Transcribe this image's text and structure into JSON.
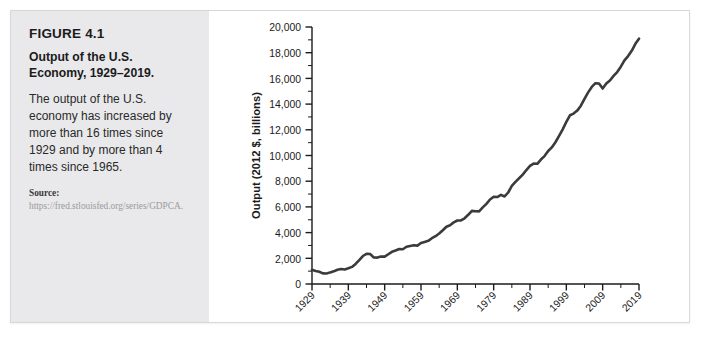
{
  "figure": {
    "number": "FIGURE 4.1",
    "title": "Output of the U.S. Economy, 1929–2019.",
    "description": "The output of the U.S. economy has increased by more than 16 times since 1929 and by more than 4 times since 1965.",
    "source_label": "Source:",
    "source_text": "https://fred.stlouisfed.org/series/GDPCA."
  },
  "colors": {
    "panel_background": "#e9e9eb",
    "chart_background": "#ffffff",
    "line": "#3b3b3b",
    "axis": "#1b1b1b",
    "text": "#1b1b1b"
  },
  "chart_data": {
    "type": "line",
    "title": "",
    "xlabel": "Year",
    "ylabel": "Output (2012 $, billions)",
    "xlim": [
      1929,
      2019
    ],
    "ylim": [
      0,
      20000
    ],
    "grid": false,
    "legend": "none",
    "xticks": [
      1929,
      1939,
      1949,
      1959,
      1969,
      1979,
      1989,
      1999,
      2009,
      2019
    ],
    "xtick_labels": [
      "1929",
      "1939",
      "1949",
      "1959",
      "1969",
      "1979",
      "1989",
      "1999",
      "2009",
      "2019"
    ],
    "xtick_rotation": 45,
    "xtick_minor_interval": 5,
    "yticks": [
      0,
      2000,
      4000,
      6000,
      8000,
      10000,
      12000,
      14000,
      16000,
      18000,
      20000
    ],
    "ytick_labels": [
      "0",
      "2,000",
      "4,000",
      "6,000",
      "8,000",
      "10,000",
      "12,000",
      "14,000",
      "16,000",
      "18,000",
      "20,000"
    ],
    "ytick_minor_interval": 1000,
    "series": [
      {
        "name": "Real GDP",
        "x": [
          1929,
          1930,
          1931,
          1932,
          1933,
          1934,
          1935,
          1936,
          1937,
          1938,
          1939,
          1940,
          1941,
          1942,
          1943,
          1944,
          1945,
          1946,
          1947,
          1948,
          1949,
          1950,
          1951,
          1952,
          1953,
          1954,
          1955,
          1956,
          1957,
          1958,
          1959,
          1960,
          1961,
          1962,
          1963,
          1964,
          1965,
          1966,
          1967,
          1968,
          1969,
          1970,
          1971,
          1972,
          1973,
          1974,
          1975,
          1976,
          1977,
          1978,
          1979,
          1980,
          1981,
          1982,
          1983,
          1984,
          1985,
          1986,
          1987,
          1988,
          1989,
          1990,
          1991,
          1992,
          1993,
          1994,
          1995,
          1996,
          1997,
          1998,
          1999,
          2000,
          2001,
          2002,
          2003,
          2004,
          2005,
          2006,
          2007,
          2008,
          2009,
          2010,
          2011,
          2012,
          2013,
          2014,
          2015,
          2016,
          2017,
          2018,
          2019
        ],
        "y": [
          1109,
          1015,
          949,
          826,
          815,
          904,
          985,
          1113,
          1170,
          1131,
          1222,
          1330,
          1566,
          1862,
          2178,
          2352,
          2329,
          2065,
          2056,
          2142,
          2131,
          2318,
          2504,
          2603,
          2724,
          2707,
          2897,
          2958,
          3015,
          2988,
          3195,
          3275,
          3359,
          3563,
          3718,
          3932,
          4186,
          4459,
          4574,
          4794,
          4943,
          4952,
          5116,
          5385,
          5692,
          5664,
          5654,
          5960,
          6234,
          6579,
          6786,
          6767,
          6938,
          6810,
          7121,
          7632,
          7951,
          8226,
          8511,
          8867,
          9192,
          9365,
          9355,
          9685,
          9952,
          10353,
          10631,
          11031,
          11522,
          12038,
          12611,
          13131,
          13262,
          13493,
          13879,
          14406,
          14913,
          15338,
          15626,
          15605,
          15209,
          15599,
          15841,
          16197,
          16495,
          16912,
          17404,
          17740,
          18144,
          18688,
          19092
        ]
      }
    ],
    "annotations": []
  }
}
